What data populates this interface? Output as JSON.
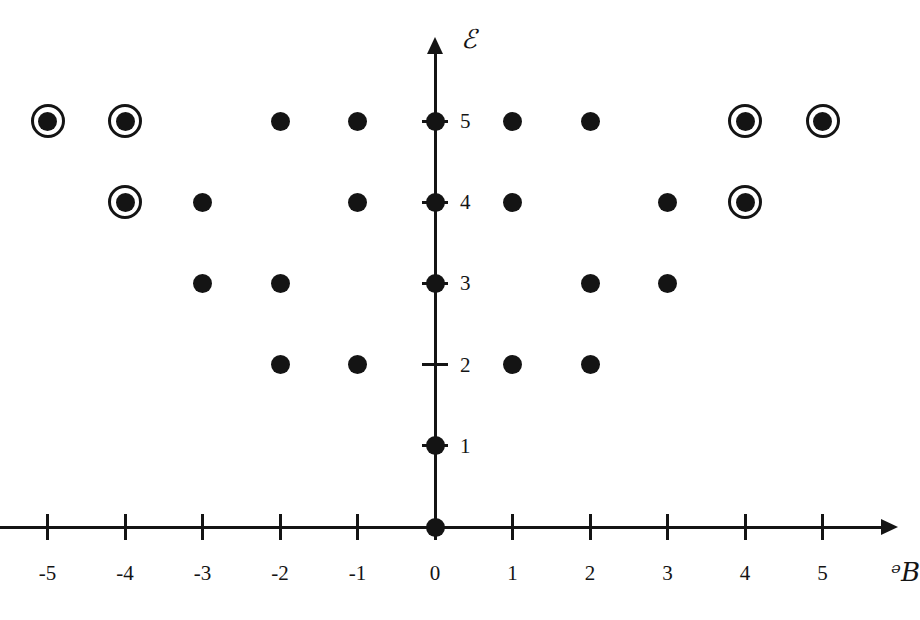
{
  "figure": {
    "background_color": "#ffffff",
    "ink_color": "#141414",
    "x_axis_title": "ᵊB",
    "y_axis_title": "ℰ"
  },
  "chart_data": {
    "type": "scatter",
    "title": "",
    "xlabel": "ᵊB",
    "ylabel": "ℰ",
    "xlim": [
      -5.6,
      5.6
    ],
    "ylim": [
      -0.4,
      5.9
    ],
    "grid": false,
    "legend_position": "none",
    "x_ticks": [
      -5,
      -4,
      -3,
      -2,
      -1,
      0,
      1,
      2,
      3,
      4,
      5
    ],
    "x_tick_labels": [
      "-5",
      "-4",
      "-3",
      "-2",
      "-1",
      "0",
      "1",
      "2",
      "3",
      "4",
      "5"
    ],
    "y_ticks": [
      1,
      2,
      3,
      4,
      5
    ],
    "y_tick_labels": [
      "1",
      "2",
      "3",
      "4",
      "5"
    ],
    "series": [
      {
        "name": "plain-point",
        "marker": "filled-circle",
        "points": [
          [
            -2,
            5
          ],
          [
            -1,
            5
          ],
          [
            0,
            5
          ],
          [
            1,
            5
          ],
          [
            2,
            5
          ],
          [
            -3,
            4
          ],
          [
            -1,
            4
          ],
          [
            0,
            4
          ],
          [
            1,
            4
          ],
          [
            3,
            4
          ],
          [
            -3,
            3
          ],
          [
            -2,
            3
          ],
          [
            0,
            3
          ],
          [
            2,
            3
          ],
          [
            3,
            3
          ],
          [
            -2,
            2
          ],
          [
            -1,
            2
          ],
          [
            1,
            2
          ],
          [
            2,
            2
          ],
          [
            0,
            1
          ],
          [
            0,
            0
          ]
        ]
      },
      {
        "name": "circled-point",
        "marker": "filled-circle-with-ring",
        "points": [
          [
            -5,
            5
          ],
          [
            -4,
            5
          ],
          [
            4,
            5
          ],
          [
            5,
            5
          ],
          [
            -4,
            4
          ],
          [
            4,
            4
          ]
        ]
      }
    ]
  }
}
